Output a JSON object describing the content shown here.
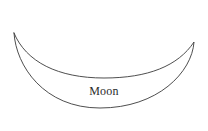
{
  "canvas": {
    "width": 208,
    "height": 131,
    "background_color": "#ffffff"
  },
  "figure": {
    "name": "moon-crescent",
    "label": "Moon",
    "label_color": "#2b2b2b",
    "stroke_color": "#3a3a3a",
    "fill_color": "#ffffff",
    "stroke_width": 0.9,
    "shape_type": "crescent",
    "left_tip": {
      "x": 14,
      "y": 33
    },
    "right_tip": {
      "x": 194,
      "y": 42
    },
    "inner_curve_low_point": {
      "x": 104,
      "y": 78
    },
    "outer_curve_low_point": {
      "x": 100,
      "y": 108
    },
    "outline_path": "M 14 33 C 26 62, 58 78, 104 78 C 148 78, 178 66, 194 42 C 192 72, 158 108, 100 108 C 44 108, 16 66, 14 33 Z"
  }
}
